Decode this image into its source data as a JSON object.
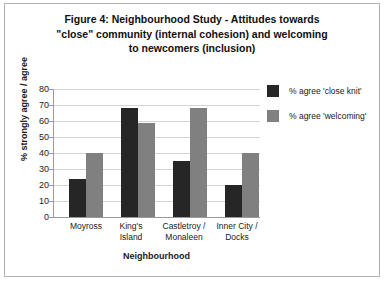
{
  "chart_data": {
    "type": "bar",
    "title": "Figure 4: Neighbourhood Study - Attitudes towards \"close\" community (internal cohesion) and welcoming to newcomers (inclusion)",
    "title_lines": [
      "Figure 4: Neighbourhood Study - Attitudes towards",
      "\"close\" community (internal cohesion) and welcoming",
      "to newcomers (inclusion)"
    ],
    "xlabel": "Neighbourhood",
    "ylabel": "% strongly agree / agree",
    "ylim": [
      0,
      80
    ],
    "ytick_labels": [
      "80",
      "70",
      "60",
      "50",
      "40",
      "30",
      "20",
      "10",
      "0"
    ],
    "ytick_values": [
      80,
      70,
      60,
      50,
      40,
      30,
      20,
      10,
      0
    ],
    "grid": true,
    "legend_position": "right",
    "categories": [
      "Moyross",
      "King's Island",
      "Castletroy / Monaleen",
      "Inner City / Docks"
    ],
    "category_lines": [
      [
        "Moyross"
      ],
      [
        "King's",
        "Island"
      ],
      [
        "Castletroy /",
        "Monaleen"
      ],
      [
        "Inner City /",
        "Docks"
      ]
    ],
    "series": [
      {
        "name": "% agree 'close knit'",
        "color": "#262626",
        "values": [
          24,
          68,
          35,
          20
        ]
      },
      {
        "name": "% agree 'welcoming'",
        "color": "#808080",
        "values": [
          40,
          59,
          68,
          40
        ]
      }
    ]
  },
  "colors": {
    "series0": "#262626",
    "series1": "#808080",
    "gridline": "#d4d4d4",
    "axis": "#9a9a9a",
    "border": "#b0b0b0",
    "background": "#ffffff",
    "text": "#1a1a1a"
  }
}
